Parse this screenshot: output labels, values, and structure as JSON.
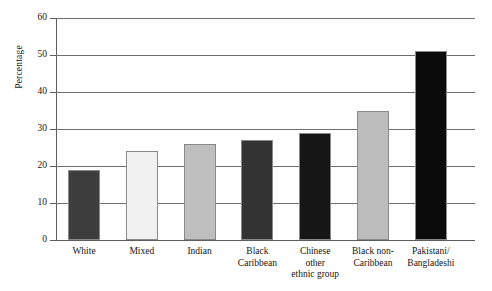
{
  "chart_data": {
    "type": "bar",
    "title": "",
    "xlabel": "",
    "ylabel": "Percentage",
    "ylim": [
      0,
      60
    ],
    "yticks": [
      0,
      10,
      20,
      30,
      40,
      50,
      60
    ],
    "grid": true,
    "legend": "none",
    "categories": [
      "White",
      "Mixed",
      "Indian",
      "Black\nCaribbean",
      "Chinese\nother\nethnic group",
      "Black non-\nCaribbean",
      "Pakistani/\nBangladeshi"
    ],
    "values": [
      19,
      24,
      26,
      27,
      29,
      35,
      51
    ],
    "bar_colors": [
      "#3d3d3d",
      "#f1f1f1",
      "#bfbfbf",
      "#333333",
      "#161616",
      "#bcbcbc",
      "#0b0b0b"
    ],
    "bar_border_color": "#8a8a8a",
    "axis_color": "#5d5d5d",
    "gridline_color": "#6f6f6f",
    "background": "#ffffff"
  }
}
